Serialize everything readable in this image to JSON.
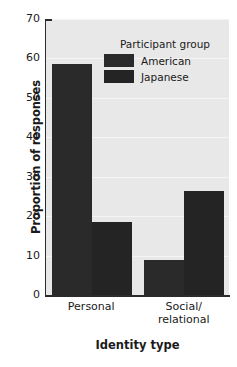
{
  "chart_data": {
    "type": "bar",
    "title": "",
    "xlabel": "Identity type",
    "ylabel": "Proportion of responses",
    "categories": [
      "Personal",
      "Social/\nrelational"
    ],
    "category_labels": [
      {
        "line1": "Personal",
        "line2": ""
      },
      {
        "line1": "Social/",
        "line2": "relational"
      }
    ],
    "series": [
      {
        "name": "American",
        "values": [
          58.7,
          8.9
        ],
        "color": "#2a2a2a"
      },
      {
        "name": "Japanese",
        "values": [
          18.5,
          26.4
        ],
        "color": "#242424"
      }
    ],
    "ylim": [
      0,
      70
    ],
    "yticks": [
      0,
      10,
      20,
      30,
      40,
      50,
      60,
      70
    ],
    "ytick_labels": [
      "0",
      "10",
      "20",
      "30",
      "40",
      "50",
      "60",
      "70"
    ],
    "grid": true,
    "grid_axis": "y",
    "legend": {
      "title": "Participant group",
      "position": "upper center inside",
      "entries": [
        "American",
        "Japanese"
      ]
    },
    "plot_background": "#e8e8e8",
    "axis_color": "#2b2b2b"
  }
}
